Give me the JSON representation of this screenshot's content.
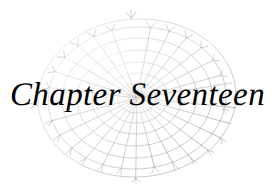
{
  "page": {
    "kind": "book-chapter-heading",
    "width": 275,
    "height": 187,
    "background_color": "#ffffff"
  },
  "heading": {
    "full_text": "Chapter Seventeen",
    "word_chapter": "Chapter",
    "word_number": "Seventeen",
    "chapter_number": 17,
    "text_color": "#000000",
    "style": "italic serif"
  },
  "illustration": {
    "name": "spider-web",
    "shape": "ellipse",
    "center_x": 137,
    "center_y": 98,
    "radius_x": 100,
    "radius_y": 80,
    "rotation_deg": -4,
    "spoke_count": 30,
    "ring_count": 8,
    "stroke_color": "#9a9a9a",
    "stroke_color_faint": "#d9d9d9",
    "has_anchor_tips": true
  }
}
